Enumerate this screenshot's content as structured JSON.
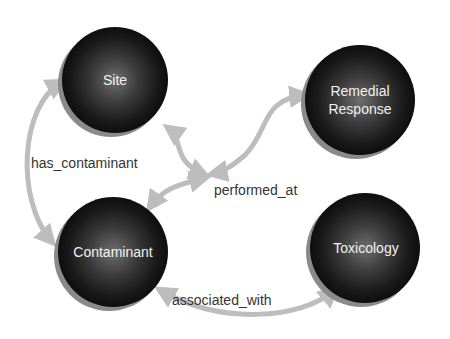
{
  "diagram": {
    "type": "concept-graph",
    "colors": {
      "background": "#ffffff",
      "node_dark": "#141414",
      "node_center": "#6e6e6e",
      "node_rim": "#8a8a8a",
      "edge": "#bdbdbd",
      "node_text": "#f2f2f2",
      "edge_text": "#333333"
    },
    "nodes": [
      {
        "id": "site",
        "label": "Site",
        "cx": 115,
        "cy": 80,
        "r": 53
      },
      {
        "id": "remedial_response",
        "label_line1": "Remedial",
        "label_line2": "Response",
        "cx": 360,
        "cy": 100,
        "r": 55
      },
      {
        "id": "contaminant",
        "label": "Contaminant",
        "cx": 113,
        "cy": 252,
        "r": 55
      },
      {
        "id": "toxicology",
        "label": "Toxicology",
        "cx": 365,
        "cy": 248,
        "r": 55
      }
    ],
    "edges": [
      {
        "id": "has_contaminant",
        "label": "has_contaminant",
        "from": "site",
        "to": "contaminant"
      },
      {
        "id": "performed_at",
        "label": "performed_at",
        "from": "remedial_response",
        "to": "site"
      },
      {
        "id": "associated_with",
        "label": "associated_with",
        "from": "contaminant",
        "to": "toxicology"
      }
    ]
  }
}
